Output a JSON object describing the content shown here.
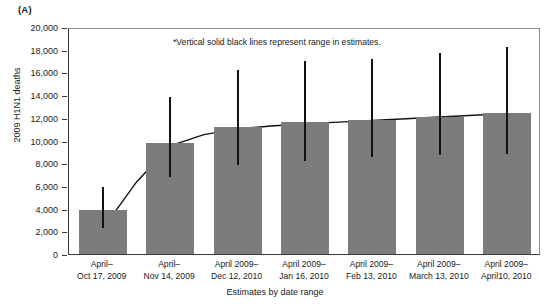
{
  "panel": {
    "label": "(A)"
  },
  "annotation": "*Vertical solid black lines represent range in estimates.",
  "axes": {
    "ylabel": "2009 H1N1 deaths",
    "xlabel": "Estimates by date range"
  },
  "colors": {
    "bar_fill": "#7c7c7c",
    "error_line": "#111111",
    "curve": "#111111",
    "frame": "#3a3a3a",
    "background": "#ffffff"
  },
  "chart_data": {
    "type": "bar",
    "title": "",
    "xlabel": "Estimates by date range",
    "ylabel": "2009 H1N1 deaths",
    "ylim": [
      0,
      20000
    ],
    "grid": false,
    "legend": false,
    "ytick_labels": [
      "0",
      "2,000",
      "4,000",
      "6,000",
      "8,000",
      "10,000",
      "12,000",
      "14,000",
      "16,000",
      "18,000",
      "20,000"
    ],
    "ytick_values": [
      0,
      2000,
      4000,
      6000,
      8000,
      10000,
      12000,
      14000,
      16000,
      18000,
      20000
    ],
    "categories": [
      "April–\nOct 17, 2009",
      "April–\nNov 14, 2009",
      "April 2009–\nDec 12, 2010",
      "April 2009–\nJan 16, 2010",
      "April 2009–\nFeb 13, 2010",
      "April 2009–\nMarch 13, 2010",
      "April 2009–\nApril10, 2010"
    ],
    "category_lines": [
      [
        "April–",
        "Oct 17, 2009"
      ],
      [
        "April–",
        "Nov 14, 2009"
      ],
      [
        "April 2009–",
        "Dec 12, 2010"
      ],
      [
        "April 2009–",
        "Jan 16, 2010"
      ],
      [
        "April 2009–",
        "Feb 13, 2010"
      ],
      [
        "April 2009–",
        "March 13, 2010"
      ],
      [
        "April 2009–",
        "April10, 2010"
      ]
    ],
    "values": [
      3900,
      9800,
      11200,
      11600,
      11800,
      12100,
      12400
    ],
    "error_low": [
      2500,
      7000,
      8000,
      8400,
      8700,
      8900,
      9000
    ],
    "error_high": [
      6100,
      14000,
      16400,
      17200,
      17400,
      17900,
      18400
    ],
    "series": [
      {
        "name": "2009 H1N1 deaths (estimate)",
        "values": [
          3900,
          9800,
          11200,
          11600,
          11800,
          12100,
          12400
        ]
      }
    ],
    "trend_curve": {
      "name": "fitted trend",
      "x_index": [
        0,
        0.5,
        1,
        1.5,
        2,
        2.5,
        3,
        3.5,
        4,
        4.5,
        5,
        5.5,
        6
      ],
      "values": [
        2400,
        6500,
        9700,
        10700,
        11200,
        11450,
        11650,
        11800,
        11950,
        12100,
        12250,
        12400,
        12550
      ]
    }
  }
}
